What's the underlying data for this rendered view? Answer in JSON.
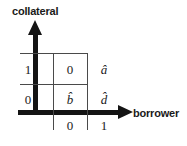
{
  "figure": {
    "type": "2x2-matrix-diagram",
    "axes": {
      "y": {
        "label": "collateral",
        "arrow": "arrow-up-icon",
        "tick_labels": [
          "1",
          "0"
        ]
      },
      "x": {
        "label": "borrower",
        "arrow": "arrow-right-icon",
        "tick_labels": [
          "0",
          "1"
        ]
      }
    },
    "matrix": {
      "rows": [
        {
          "row_label": "1",
          "cells": [
            "0",
            "â"
          ]
        },
        {
          "row_label": "0",
          "cells": [
            "b̂",
            "d̂"
          ]
        }
      ],
      "column_labels": [
        "0",
        "1"
      ]
    },
    "colors": {
      "axis": "#141414",
      "grid": "#4a4a4a",
      "text": "#1a1a1a",
      "background": "#ffffff"
    }
  }
}
